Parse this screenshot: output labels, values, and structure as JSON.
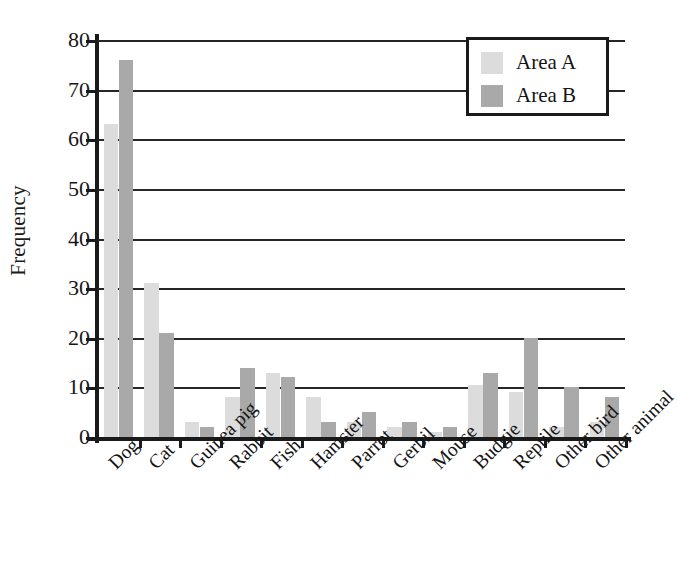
{
  "chart_data": {
    "type": "bar",
    "title": "",
    "xlabel": "",
    "ylabel": "Frequency",
    "ylim": [
      0,
      80
    ],
    "yticks": [
      0,
      10,
      20,
      30,
      40,
      50,
      60,
      70,
      80
    ],
    "grid": true,
    "legend_position": "top-right",
    "categories": [
      "Dog",
      "Cat",
      "Guinea pig",
      "Rabbit",
      "Fish",
      "Hamster",
      "Parrot",
      "Gerbil",
      "Mouse",
      "Budgie",
      "Reptile",
      "Other bird",
      "Other animal"
    ],
    "series": [
      {
        "name": "Area A",
        "color": "#dcdcdc",
        "values": [
          63,
          31,
          3,
          8,
          13,
          8,
          3,
          2,
          1,
          10.5,
          9,
          2,
          3
        ]
      },
      {
        "name": "Area B",
        "color": "#a9a9a9",
        "values": [
          76,
          21,
          2,
          14,
          12,
          3,
          5,
          3,
          2,
          13,
          20,
          10,
          8
        ]
      }
    ]
  },
  "axes": {
    "y_title": "Frequency",
    "y_tick_labels": [
      "0",
      "10",
      "20",
      "30",
      "40",
      "50",
      "60",
      "70",
      "80"
    ]
  },
  "legend": {
    "entries": [
      {
        "label": "Area A",
        "swatch": "light-gray-swatch"
      },
      {
        "label": "Area B",
        "swatch": "medium-gray-swatch"
      }
    ]
  }
}
